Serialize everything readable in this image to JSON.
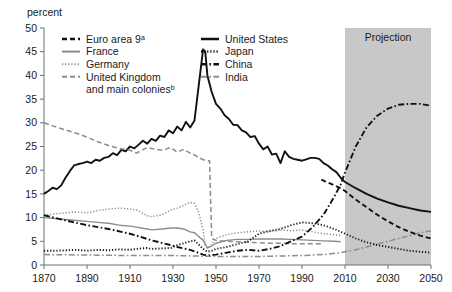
{
  "axis_label_y": "percent",
  "projection_label": "Projection",
  "legend_left": [
    {
      "label": "Euro area 9",
      "sup": "a",
      "style": "dashed-black",
      "color": "#111111"
    },
    {
      "label": "France",
      "sup": "",
      "style": "solid-gray",
      "color": "#8c8c8c"
    },
    {
      "label": "Germany",
      "sup": "",
      "style": "dotted-gray",
      "color": "#8c8c8c"
    },
    {
      "label": "United Kingdom",
      "sup": "",
      "style": "dashed-gray",
      "color": "#8c8c8c"
    },
    {
      "label": "and main colonies",
      "sup": "b",
      "style": "none",
      "color": "#8c8c8c"
    }
  ],
  "legend_right": [
    {
      "label": "United States",
      "sup": "",
      "style": "solid-black",
      "color": "#111111"
    },
    {
      "label": "Japan",
      "sup": "",
      "style": "dotted-black",
      "color": "#111111"
    },
    {
      "label": "China",
      "sup": "",
      "style": "dashdot-black",
      "color": "#111111"
    },
    {
      "label": "India",
      "sup": "",
      "style": "dashdot-gray",
      "color": "#8c8c8c"
    }
  ],
  "chart_data": {
    "type": "line",
    "title": "",
    "xlabel": "",
    "ylabel": "percent",
    "xlim": [
      1870,
      2050
    ],
    "ylim": [
      0,
      50
    ],
    "xticks": [
      1870,
      1890,
      1910,
      1930,
      1950,
      1970,
      1990,
      2010,
      2030,
      2050
    ],
    "yticks": [
      0,
      5,
      10,
      15,
      20,
      25,
      30,
      35,
      40,
      45,
      50
    ],
    "grid": false,
    "legend_position": "top-inside",
    "shaded_region": {
      "label": "Projection",
      "x_start": 2010,
      "x_end": 2050,
      "color": "#c8c8c8"
    },
    "series": [
      {
        "name": "United States",
        "style": "solid-black",
        "color": "#111111",
        "x": [
          1870,
          1872,
          1874,
          1876,
          1878,
          1880,
          1882,
          1884,
          1886,
          1888,
          1890,
          1892,
          1894,
          1896,
          1898,
          1900,
          1902,
          1904,
          1906,
          1908,
          1910,
          1912,
          1914,
          1916,
          1918,
          1920,
          1922,
          1924,
          1926,
          1928,
          1930,
          1932,
          1934,
          1936,
          1938,
          1940,
          1942,
          1944,
          1945,
          1946,
          1948,
          1950,
          1952,
          1954,
          1956,
          1958,
          1960,
          1962,
          1964,
          1966,
          1968,
          1970,
          1972,
          1974,
          1976,
          1978,
          1980,
          1982,
          1984,
          1986,
          1988,
          1990,
          1992,
          1994,
          1996,
          1998,
          2000,
          2002,
          2004,
          2006,
          2008,
          2010,
          2015,
          2020,
          2025,
          2030,
          2035,
          2040,
          2045,
          2050
        ],
        "y": [
          15.0,
          15.6,
          16.3,
          16.0,
          16.8,
          18.4,
          19.8,
          21.0,
          21.3,
          21.5,
          21.8,
          21.5,
          22.2,
          22.0,
          22.6,
          22.8,
          23.6,
          23.2,
          24.3,
          24.0,
          25.0,
          24.6,
          25.4,
          26.2,
          25.6,
          26.6,
          26.2,
          27.3,
          27.0,
          28.4,
          27.8,
          29.2,
          28.4,
          30.2,
          29.0,
          30.5,
          38.0,
          45.5,
          45.0,
          40.0,
          36.5,
          34.0,
          33.0,
          31.6,
          30.8,
          29.6,
          29.5,
          28.4,
          28.0,
          27.0,
          27.2,
          25.6,
          24.4,
          25.0,
          23.3,
          23.5,
          21.5,
          24.0,
          22.8,
          22.4,
          22.2,
          22.0,
          22.3,
          22.6,
          22.6,
          22.4,
          21.5,
          21.0,
          20.2,
          19.6,
          18.4,
          17.5,
          16.2,
          15.0,
          14.0,
          13.2,
          12.5,
          12.0,
          11.5,
          11.2
        ]
      },
      {
        "name": "United Kingdom and main colonies",
        "style": "dashed-gray",
        "color": "#8c8c8c",
        "x": [
          1870,
          1875,
          1880,
          1885,
          1890,
          1895,
          1900,
          1905,
          1910,
          1913,
          1918,
          1920,
          1925,
          1929,
          1932,
          1935,
          1938,
          1940,
          1944,
          1947,
          1948,
          1949,
          1950,
          1955,
          1960,
          1965,
          1970,
          1975,
          1980,
          1985,
          1990,
          1995,
          2000
        ],
        "y": [
          30.0,
          29.2,
          28.5,
          27.8,
          27.0,
          26.0,
          25.2,
          24.6,
          24.2,
          23.6,
          24.8,
          24.6,
          24.2,
          24.8,
          23.8,
          24.4,
          23.6,
          23.2,
          22.2,
          22.0,
          5.6,
          5.4,
          5.2,
          5.0,
          4.9,
          4.8,
          4.7,
          4.6,
          4.6,
          4.5,
          4.5,
          4.5,
          4.5
        ]
      },
      {
        "name": "Germany",
        "style": "dotted-gray",
        "color": "#8c8c8c",
        "x": [
          1870,
          1875,
          1880,
          1885,
          1890,
          1895,
          1900,
          1905,
          1910,
          1913,
          1918,
          1920,
          1925,
          1929,
          1932,
          1935,
          1938,
          1940,
          1942,
          1944,
          1945,
          1946,
          1948,
          1950,
          1955,
          1960,
          1965,
          1970,
          1975,
          1980,
          1985,
          1990,
          1995,
          2000,
          2005,
          2008
        ],
        "y": [
          10.5,
          10.8,
          11.0,
          11.2,
          11.0,
          11.5,
          11.8,
          12.0,
          11.8,
          11.6,
          10.4,
          10.2,
          10.6,
          11.6,
          12.0,
          12.6,
          13.2,
          13.0,
          11.0,
          7.5,
          4.0,
          3.5,
          4.4,
          5.6,
          6.4,
          6.8,
          7.0,
          7.2,
          7.0,
          7.4,
          7.2,
          7.4,
          7.0,
          6.6,
          6.4,
          6.2
        ]
      },
      {
        "name": "France",
        "style": "solid-gray",
        "color": "#8c8c8c",
        "x": [
          1870,
          1875,
          1880,
          1885,
          1890,
          1895,
          1900,
          1905,
          1910,
          1913,
          1918,
          1920,
          1925,
          1929,
          1932,
          1935,
          1938,
          1940,
          1944,
          1946,
          1948,
          1950,
          1955,
          1960,
          1965,
          1970,
          1975,
          1980,
          1985,
          1990,
          1995,
          2000,
          2005,
          2008
        ],
        "y": [
          10.0,
          9.8,
          9.6,
          9.4,
          9.2,
          9.0,
          8.8,
          8.4,
          8.2,
          8.0,
          7.6,
          7.4,
          7.6,
          7.8,
          7.8,
          7.6,
          7.0,
          6.8,
          5.2,
          3.6,
          4.0,
          4.6,
          5.2,
          5.4,
          5.4,
          5.5,
          5.5,
          5.5,
          5.4,
          5.3,
          5.2,
          5.1,
          5.0,
          4.9
        ]
      },
      {
        "name": "Japan",
        "style": "dotted-black",
        "color": "#111111",
        "x": [
          1870,
          1875,
          1880,
          1885,
          1890,
          1895,
          1900,
          1905,
          1910,
          1913,
          1918,
          1920,
          1925,
          1929,
          1932,
          1935,
          1938,
          1940,
          1944,
          1946,
          1948,
          1950,
          1955,
          1960,
          1965,
          1970,
          1975,
          1980,
          1985,
          1990,
          1995,
          2000,
          2005,
          2008,
          2010,
          2015,
          2020,
          2025,
          2030,
          2035,
          2040,
          2045,
          2050
        ],
        "y": [
          3.0,
          3.0,
          3.1,
          3.2,
          3.0,
          3.2,
          3.1,
          3.3,
          3.2,
          3.4,
          3.6,
          3.4,
          3.5,
          3.6,
          4.2,
          4.6,
          5.0,
          5.2,
          3.4,
          2.8,
          3.0,
          3.4,
          3.8,
          4.4,
          5.0,
          6.6,
          7.2,
          7.6,
          8.4,
          9.0,
          8.8,
          8.4,
          7.6,
          7.0,
          6.6,
          5.6,
          4.8,
          4.2,
          3.8,
          3.4,
          3.0,
          2.8,
          2.6
        ]
      },
      {
        "name": "China",
        "style": "dashdot-black",
        "color": "#111111",
        "x": [
          1870,
          1880,
          1890,
          1900,
          1910,
          1913,
          1920,
          1929,
          1932,
          1938,
          1944,
          1946,
          1950,
          1955,
          1960,
          1965,
          1970,
          1975,
          1980,
          1985,
          1990,
          1995,
          2000,
          2005,
          2008,
          2010,
          2015,
          2020,
          2025,
          2030,
          2035,
          2040,
          2045,
          2050
        ],
        "y": [
          10.5,
          9.4,
          8.4,
          7.6,
          6.6,
          6.2,
          5.2,
          4.2,
          3.8,
          3.2,
          2.2,
          2.0,
          2.2,
          2.6,
          3.0,
          3.2,
          3.0,
          3.4,
          4.0,
          5.0,
          6.0,
          8.0,
          10.6,
          14.4,
          17.0,
          19.5,
          25.0,
          29.0,
          31.5,
          33.0,
          33.8,
          34.0,
          34.0,
          33.6
        ]
      },
      {
        "name": "India",
        "style": "dashdot-gray",
        "color": "#8c8c8c",
        "x": [
          1870,
          1890,
          1910,
          1930,
          1950,
          1960,
          1970,
          1980,
          1990,
          2000,
          2008,
          2010,
          2015,
          2020,
          2025,
          2030,
          2035,
          2040,
          2045,
          2050
        ],
        "y": [
          2.2,
          2.1,
          2.0,
          2.0,
          1.8,
          1.8,
          1.8,
          1.9,
          2.0,
          2.2,
          2.6,
          2.8,
          3.2,
          3.8,
          4.4,
          5.0,
          5.6,
          6.2,
          6.8,
          7.2
        ]
      },
      {
        "name": "Euro area 9",
        "style": "dashed-black",
        "color": "#111111",
        "x": [
          1999,
          2001,
          2003,
          2005,
          2008,
          2010,
          2015,
          2020,
          2025,
          2030,
          2035,
          2040,
          2045,
          2050
        ],
        "y": [
          18.0,
          17.6,
          17.2,
          16.8,
          16.2,
          15.6,
          13.8,
          12.2,
          10.6,
          9.2,
          8.0,
          7.0,
          6.2,
          5.6
        ]
      }
    ]
  }
}
